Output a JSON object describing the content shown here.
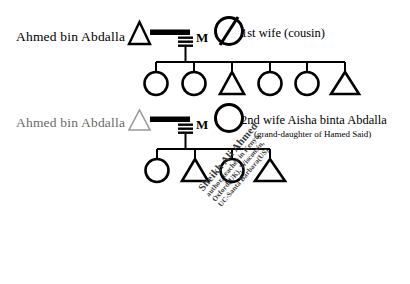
{
  "diagram": {
    "type": "kinship-pedigree",
    "background_color": "#ffffff",
    "line_color": "#000000",
    "faded_color": "#6a6a6a"
  },
  "family1": {
    "father_label": "Ahmed bin Abdalla",
    "marriage_marker": "M",
    "wife_label": "1st wife (cousin)",
    "wife_symbol": "circle-slashed",
    "children": [
      {
        "symbol": "circle",
        "sex": "female"
      },
      {
        "symbol": "circle",
        "sex": "female"
      },
      {
        "symbol": "triangle",
        "sex": "male"
      },
      {
        "symbol": "circle",
        "sex": "female"
      },
      {
        "symbol": "circle",
        "sex": "female"
      },
      {
        "symbol": "triangle",
        "sex": "male"
      }
    ]
  },
  "family2": {
    "father_label": "Ahmed bin Abdalla",
    "marriage_marker": "M",
    "wife_label": "2nd wife Aisha binta Abdalla",
    "wife_sublabel": "(grand-daughter of Hamed Said)",
    "wife_symbol": "circle",
    "children": [
      {
        "symbol": "circle",
        "sex": "female"
      },
      {
        "symbol": "triangle",
        "sex": "male"
      },
      {
        "symbol": "circle",
        "sex": "female"
      },
      {
        "symbol": "triangle",
        "sex": "male"
      }
    ]
  },
  "annotation": {
    "rotation_degrees": -50,
    "line1": "Sheikh Ali Ahmed",
    "line2": "author, teacher in Kenya,",
    "line3": "Oxford(UK), Wisconsin,",
    "line4": "UC-Santa Barbara(US)"
  }
}
